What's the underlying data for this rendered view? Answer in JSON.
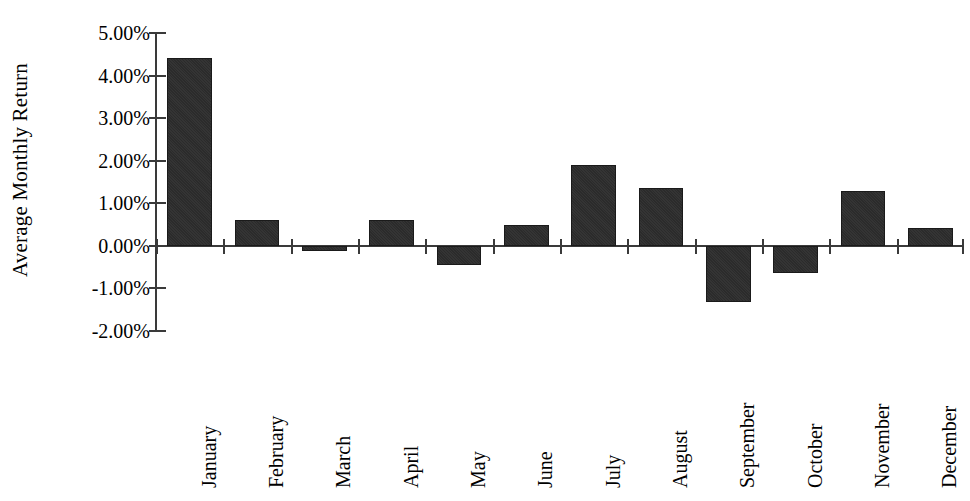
{
  "chart_data": {
    "type": "bar",
    "title": "",
    "subtitle": "",
    "xlabel": "",
    "ylabel": "Average Monthly Return",
    "categories": [
      "January",
      "February",
      "March",
      "April",
      "May",
      "June",
      "July",
      "August",
      "September",
      "October",
      "November",
      "December"
    ],
    "values": [
      4.42,
      0.6,
      -0.12,
      0.61,
      -0.45,
      0.49,
      1.9,
      1.35,
      -1.32,
      -0.63,
      1.3,
      0.43
    ],
    "value_labels": [
      "4.42%",
      "0.60%",
      "-0.12%",
      "0.61%",
      "-0.45%",
      "0.49%",
      "1.90%",
      "1.35%",
      "-1.32%",
      "-0.63%",
      "1.30%",
      "0.43%"
    ],
    "ylim": [
      -2.0,
      5.0
    ],
    "ytick_values": [
      5.0,
      4.0,
      3.0,
      2.0,
      1.0,
      0.0,
      -1.0,
      -2.0
    ],
    "ytick_labels": [
      "5.00%",
      "4.00%",
      "3.00%",
      "2.00%",
      "1.00%",
      "0.00%",
      "-1.00%",
      "-2.00%"
    ],
    "grid": false,
    "legend": false,
    "legend_position": "none",
    "bar_color": "#2b2b2b",
    "axis_color": "#3a3a3a",
    "background_color": "#ffffff",
    "x_labels_rotation_degrees": 90
  },
  "axis": {
    "y_title": "Average Monthly Return"
  }
}
